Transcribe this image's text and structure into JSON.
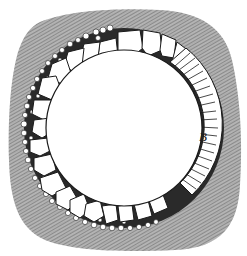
{
  "figure": {
    "type": "cross-section engraving",
    "labels": [
      {
        "id": "B",
        "text": "B",
        "refers_to": "brick lining segment (right side)"
      }
    ],
    "colors": {
      "background": "#ffffff",
      "earth_hatch": "#8a8a8a",
      "earth_fill": "#a9a9a9",
      "ink": "#1a1a1a",
      "stone_fill": "#ffffff"
    },
    "geometry": {
      "center": [
        124,
        128
      ],
      "inner_radius": 78,
      "lining_outer_radius": 98,
      "brick_arc_degrees": [
        -58,
        52
      ]
    }
  }
}
